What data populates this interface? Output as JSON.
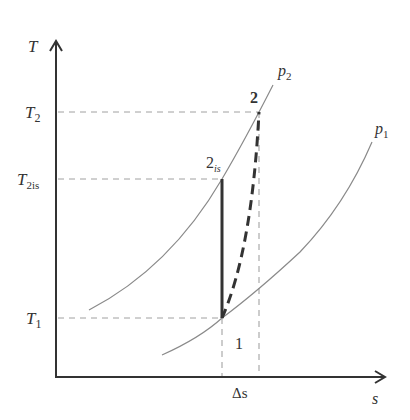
{
  "diagram": {
    "type": "T-s diagram (compression process)",
    "axes": {
      "y_label": "T",
      "x_label": "s"
    },
    "temperature_levels": {
      "T2": {
        "base": "T",
        "sub": "2"
      },
      "T2is": {
        "base": "T",
        "sub": "2is"
      },
      "T1": {
        "base": "T",
        "sub": "1"
      }
    },
    "isobars": {
      "p2": {
        "base": "p",
        "sub": "2"
      },
      "p1": {
        "base": "p",
        "sub": "1"
      }
    },
    "points": {
      "state_1": "1",
      "state_2": "2",
      "state_2is": {
        "base": "2",
        "sub": "is"
      }
    },
    "delta_s_label": "Δs",
    "colors": {
      "axis": "#333333",
      "curve": "#8a8a8a",
      "process": "#333333",
      "guide": "#9a9a9a"
    }
  }
}
